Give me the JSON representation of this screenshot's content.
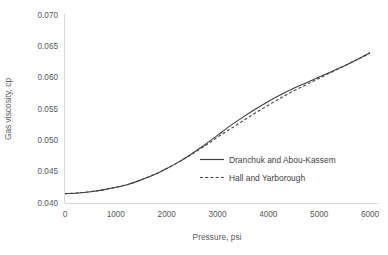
{
  "chart_data": {
    "type": "line",
    "title": "",
    "xlabel": "Pressure, psi",
    "ylabel": "Gas viscosity, cp",
    "xlim": [
      0,
      6000
    ],
    "ylim": [
      0.04,
      0.07
    ],
    "xticks": [
      0,
      1000,
      2000,
      3000,
      4000,
      5000,
      6000
    ],
    "yticks": [
      0.04,
      0.045,
      0.05,
      0.055,
      0.06,
      0.065,
      0.07
    ],
    "xtick_labels": [
      "0",
      "1000",
      "2000",
      "3000",
      "4000",
      "5000",
      "6000"
    ],
    "ytick_labels": [
      "0.040",
      "0.045",
      "0.050",
      "0.055",
      "0.060",
      "0.065",
      "0.070"
    ],
    "grid": false,
    "legend_position": "inside-center-right",
    "x": [
      0,
      250,
      500,
      750,
      1000,
      1250,
      1500,
      1750,
      2000,
      2250,
      2500,
      2750,
      3000,
      3250,
      3500,
      3750,
      4000,
      4250,
      4500,
      4750,
      5000,
      5250,
      5500,
      5750,
      6000
    ],
    "series": [
      {
        "name": "Dranchuk and Abou-Kassem",
        "style": "solid",
        "color": "#404040",
        "values": [
          0.0415,
          0.0416,
          0.0418,
          0.0421,
          0.0425,
          0.043,
          0.0437,
          0.0445,
          0.0455,
          0.0466,
          0.0479,
          0.0493,
          0.0508,
          0.0523,
          0.0537,
          0.055,
          0.0562,
          0.0573,
          0.0583,
          0.0592,
          0.0601,
          0.061,
          0.0619,
          0.0629,
          0.064
        ]
      },
      {
        "name": "Hall and Yarborough",
        "style": "dashed",
        "color": "#404040",
        "values": [
          0.0415,
          0.0416,
          0.0418,
          0.0421,
          0.0425,
          0.043,
          0.0437,
          0.0445,
          0.0455,
          0.0466,
          0.0478,
          0.0491,
          0.0505,
          0.0518,
          0.0531,
          0.0544,
          0.0556,
          0.0568,
          0.0579,
          0.0589,
          0.0599,
          0.0609,
          0.0619,
          0.0629,
          0.0639
        ]
      }
    ],
    "legend_entries": [
      {
        "label": "Dranchuk and Abou-Kassem",
        "style": "solid"
      },
      {
        "label": "Hall and Yarborough",
        "style": "dashed"
      }
    ],
    "colors": {
      "line": "#404040",
      "axis": "#d9d9d9",
      "tick_text": "#595959",
      "background": "#ffffff"
    }
  }
}
